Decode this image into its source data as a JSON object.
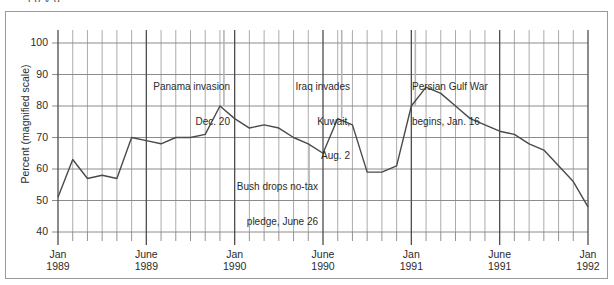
{
  "figure": {
    "cut_title": "            l           p          y           g",
    "border_color": "#9a9a9a"
  },
  "axes": {
    "ylabel": "Percent (magnified scale)",
    "yticks": [
      "100",
      "90",
      "80",
      "70",
      "60",
      "50",
      "40"
    ],
    "xticks": [
      {
        "month": "Jan",
        "year": "1989"
      },
      {
        "month": "June",
        "year": "1989"
      },
      {
        "month": "Jan",
        "year": "1990"
      },
      {
        "month": "June",
        "year": "1990"
      },
      {
        "month": "Jan",
        "year": "1991"
      },
      {
        "month": "June",
        "year": "1991"
      },
      {
        "month": "Jan",
        "year": "1992"
      }
    ]
  },
  "annotations": [
    {
      "id": "panama",
      "line1": "Panama invasion",
      "line2": "Dec. 20"
    },
    {
      "id": "iraq",
      "line1": "Iraq invades",
      "line2": "Kuwait,",
      "line3": "Aug. 2"
    },
    {
      "id": "gulf-war",
      "line1": "Persian Gulf War",
      "line2": "begins, Jan. 16"
    },
    {
      "id": "no-tax-pledge",
      "line1": "Bush drops no-tax",
      "line2": "pledge, June 26"
    }
  ],
  "chart_data": {
    "type": "line",
    "title": "",
    "xlabel": "",
    "ylabel": "Percent (magnified scale)",
    "ylim": [
      40,
      100
    ],
    "ytick_values": [
      40,
      50,
      60,
      70,
      80,
      90,
      100
    ],
    "grid": true,
    "legend": "none",
    "line_color": "#4a4a4a",
    "x": [
      "Jan 1989",
      "Feb 1989",
      "Mar 1989",
      "Apr 1989",
      "May 1989",
      "June 1989",
      "July 1989",
      "Aug 1989",
      "Sept 1989",
      "Oct 1989",
      "Nov 1989",
      "Dec 1989",
      "Jan 1990",
      "Feb 1990",
      "Mar 1990",
      "Apr 1990",
      "May 1990",
      "June 1990",
      "July 1990",
      "Aug 1990",
      "Sept 1990",
      "Oct 1990",
      "Nov 1990",
      "Dec 1990",
      "Jan 1991",
      "Feb 1991",
      "Mar 1991",
      "Apr 1991",
      "May 1991",
      "June 1991",
      "July 1991",
      "Aug 1991",
      "Sept 1991",
      "Oct 1991",
      "Nov 1991",
      "Dec 1991",
      "Jan 1992"
    ],
    "values": [
      51,
      63,
      57,
      58,
      57,
      70,
      69,
      68,
      70,
      70,
      71,
      80,
      76,
      73,
      74,
      73,
      70,
      68,
      65,
      76,
      74,
      59,
      59,
      61,
      80,
      86,
      84,
      80,
      76,
      74,
      72,
      71,
      68,
      66,
      61,
      56,
      48
    ],
    "annotated_points": [
      {
        "label": "Panama invasion Dec. 20",
        "x": "Dec 1989",
        "y": 80
      },
      {
        "label": "Bush drops no-tax pledge, June 26",
        "x": "June 1990",
        "y": 68
      },
      {
        "label": "Iraq invades Kuwait, Aug. 2",
        "x": "Aug 1990",
        "y": 76
      },
      {
        "label": "Persian Gulf War begins, Jan. 16",
        "x": "Jan 1991",
        "y": 80
      }
    ]
  }
}
